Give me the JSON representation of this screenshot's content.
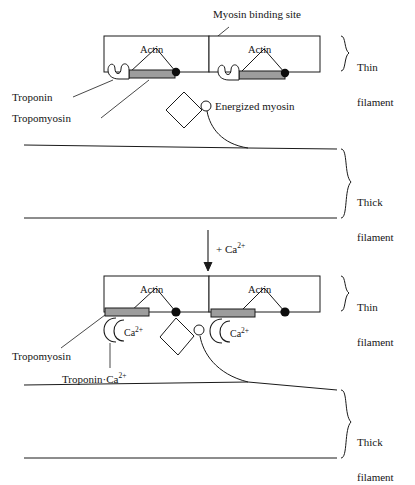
{
  "figure": {
    "type": "biology-diagram",
    "transition_label": "+ Ca2+"
  },
  "panels": [
    {
      "id": "relaxed",
      "name": "relaxed-state-panel",
      "callouts": {
        "myosin_binding_site": "Myosin binding site",
        "troponin": "Troponin",
        "tropomyosin": "Tropomyosin",
        "energized_myosin": "Energized myosin"
      },
      "actin_units": [
        {
          "label": "Actin"
        },
        {
          "label": "Actin"
        }
      ],
      "braces": [
        {
          "name": "thin-filament-brace",
          "line1": "Thin",
          "line2": "filament"
        },
        {
          "name": "thick-filament-brace",
          "line1": "Thick",
          "line2": "filament"
        }
      ]
    },
    {
      "id": "activated",
      "name": "calcium-bound-state-panel",
      "callouts": {
        "tropomyosin": "Tropomyosin",
        "troponin_ca": "Troponin·Ca",
        "troponin_ca_sup": "2+"
      },
      "actin_units": [
        {
          "label": "Actin"
        },
        {
          "label": "Actin"
        }
      ],
      "calcium_tags": [
        {
          "text": "Ca",
          "sup": "2+"
        },
        {
          "text": "Ca",
          "sup": "2+"
        }
      ],
      "braces": [
        {
          "name": "thin-filament-brace",
          "line1": "Thin",
          "line2": "filament"
        },
        {
          "name": "thick-filament-brace",
          "line1": "Thick",
          "line2": "filament"
        }
      ]
    }
  ],
  "arrow": {
    "name": "calcium-addition-arrow",
    "text": "+ Ca",
    "sup": "2+"
  },
  "colors": {
    "stroke": "#1a1a1a",
    "tropomyosin_fill": "#9d9d9d",
    "binding_site_fill": "#0d0d0d",
    "background": "#ffffff"
  }
}
